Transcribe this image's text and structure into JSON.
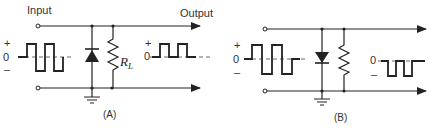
{
  "figure": {
    "panels": [
      {
        "id": "A",
        "caption": "(A)",
        "input_label": "Input",
        "output_label": "Output",
        "resistor_label": "R",
        "resistor_subscript": "L",
        "diode_orientation": "anode-bottom (points up)",
        "input_wave": {
          "plus": "+",
          "zero": "0",
          "minus": "–"
        },
        "output_wave": {
          "plus": "+",
          "zero": "0",
          "polarity": "positive pulses only"
        }
      },
      {
        "id": "B",
        "caption": "(B)",
        "diode_orientation": "anode-top (points down)",
        "input_wave": {
          "plus": "+",
          "zero": "0",
          "minus": "–"
        },
        "output_wave": {
          "zero": "0",
          "minus": "–",
          "polarity": "negative pulses only"
        }
      }
    ]
  }
}
